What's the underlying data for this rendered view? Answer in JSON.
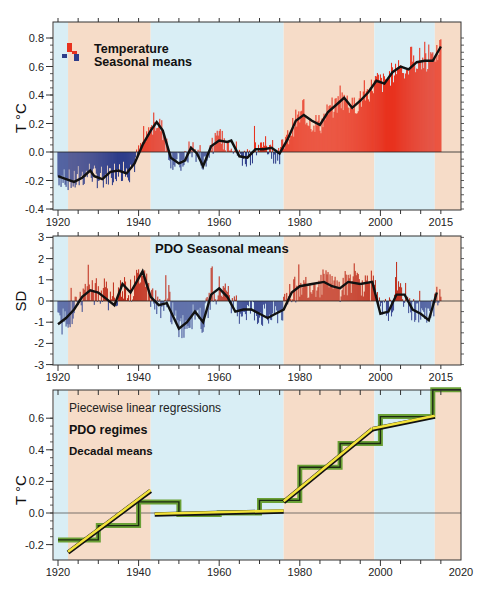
{
  "chart_data": [
    {
      "type": "bar",
      "title": "Temperature Seasonal means",
      "legend": [
        "Temperature",
        "Seasonal means"
      ],
      "ylabel": "T °C",
      "xlabel": "",
      "ylim": [
        -0.4,
        0.85
      ],
      "xlim": [
        1919,
        2020
      ],
      "yticks": [
        "0.8",
        "0.6",
        "0.4",
        "0.2",
        "0.0",
        "-0.2",
        "-0.4"
      ],
      "xticks": [
        "1920",
        "1940",
        "1960",
        "1980",
        "2000",
        "2015"
      ],
      "colors": {
        "positive": "#e8321e",
        "negative": "#2e3d8a",
        "smooth": "#111111"
      },
      "smoothed_curve": {
        "x": [
          1920,
          1922,
          1924,
          1926,
          1928,
          1929,
          1931,
          1933,
          1935,
          1937,
          1939,
          1941,
          1943,
          1944.5,
          1946,
          1948,
          1950,
          1951.5,
          1953,
          1954.5,
          1956,
          1958,
          1960,
          1962,
          1963,
          1965,
          1967,
          1969,
          1971,
          1973,
          1975,
          1977,
          1979,
          1981,
          1983,
          1985,
          1987,
          1989,
          1991,
          1993,
          1995,
          1997,
          1999,
          2001,
          2003,
          2005,
          2007,
          2009,
          2011,
          2013,
          2015
        ],
        "y": [
          -0.17,
          -0.19,
          -0.21,
          -0.18,
          -0.13,
          -0.17,
          -0.19,
          -0.14,
          -0.13,
          -0.15,
          -0.08,
          0.05,
          0.15,
          0.21,
          0.15,
          -0.04,
          -0.08,
          -0.06,
          0.03,
          -0.01,
          -0.1,
          0.04,
          0.08,
          0.07,
          0.08,
          -0.03,
          -0.04,
          0.02,
          0.02,
          0.03,
          -0.01,
          0.09,
          0.22,
          0.26,
          0.22,
          0.19,
          0.28,
          0.33,
          0.38,
          0.31,
          0.36,
          0.42,
          0.5,
          0.48,
          0.56,
          0.6,
          0.58,
          0.63,
          0.64,
          0.64,
          0.74
        ]
      }
    },
    {
      "type": "bar",
      "title": "PDO Seasonal means",
      "ylabel": "SD",
      "xlabel": "",
      "ylim": [
        -3,
        3
      ],
      "xlim": [
        1919,
        2020
      ],
      "yticks": [
        "3",
        "2",
        "1",
        "0",
        "-1",
        "-2",
        "-3"
      ],
      "xticks": [
        "1920",
        "1940",
        "1960",
        "1980",
        "2000",
        "2015"
      ],
      "colors": {
        "positive": "#c0301e",
        "negative": "#3f4f96",
        "smooth": "#111111"
      },
      "smoothed_curve": {
        "x": [
          1920,
          1922,
          1924,
          1926,
          1928,
          1930,
          1932,
          1934,
          1936,
          1938,
          1941,
          1943,
          1945,
          1947,
          1950,
          1952,
          1954,
          1956,
          1958,
          1960,
          1962,
          1964,
          1966,
          1968,
          1970,
          1972,
          1974,
          1976,
          1978,
          1980,
          1983,
          1986,
          1988,
          1990,
          1992,
          1995,
          1998,
          2000,
          2002,
          2004,
          2006,
          2008,
          2010,
          2012,
          2014
        ],
        "y": [
          -1.1,
          -0.8,
          -0.4,
          0.2,
          0.5,
          0.4,
          0.1,
          -0.2,
          0.8,
          0.4,
          1.4,
          0.2,
          -0.2,
          -0.1,
          -1.3,
          -1.0,
          -0.5,
          -1.0,
          0.3,
          0.6,
          0.2,
          -0.5,
          -0.4,
          -0.4,
          -0.6,
          -0.8,
          -0.6,
          -0.4,
          0.4,
          0.7,
          0.8,
          0.9,
          0.7,
          0.6,
          0.9,
          0.8,
          0.9,
          -0.6,
          -0.5,
          0.3,
          0.3,
          -0.4,
          -0.6,
          -0.9,
          0.4
        ]
      }
    },
    {
      "type": "line",
      "title": "",
      "ylabel": "T °C",
      "xlabel": "",
      "ylim": [
        -0.27,
        0.8
      ],
      "xlim": [
        1919,
        2020
      ],
      "yticks": [
        "0.6",
        "0.4",
        "0.2",
        "0.0",
        "-0.2"
      ],
      "xticks": [
        "1920",
        "1940",
        "1960",
        "1980",
        "2000",
        "2020"
      ],
      "annotations": [
        "Piecewise linear regressions",
        "PDO regimes",
        "Decadal means"
      ],
      "series": [
        {
          "name": "Decadal means",
          "color": "#6aa036",
          "x": [
            1920,
            1930,
            1930,
            1940,
            1940,
            1950,
            1950,
            1960,
            1960,
            1970,
            1970,
            1975,
            1975,
            1980,
            1980,
            1990,
            1990,
            2000,
            2000,
            2013,
            2013,
            2020
          ],
          "y": [
            -0.17,
            -0.17,
            -0.08,
            -0.08,
            0.07,
            0.07,
            -0.01,
            -0.01,
            0.0,
            0.0,
            0.08,
            0.08,
            0.08,
            0.08,
            0.29,
            0.29,
            0.44,
            0.44,
            0.61,
            0.61,
            0.78,
            0.78
          ]
        },
        {
          "name": "Piecewise linear regressions (PDO regimes)",
          "color": "#f2e23a",
          "segments": [
            {
              "x": [
                1922.5,
                1943
              ],
              "y": [
                -0.25,
                0.14
              ]
            },
            {
              "x": [
                1944,
                1976
              ],
              "y": [
                -0.01,
                0.01
              ]
            },
            {
              "x": [
                1976,
                1998
              ],
              "y": [
                0.07,
                0.53
              ]
            },
            {
              "x": [
                1998,
                2013.5
              ],
              "y": [
                0.53,
                0.61
              ]
            }
          ]
        }
      ]
    }
  ],
  "regimes": [
    {
      "start": 1919,
      "end": 1922.5,
      "phase": "cool",
      "color": "#d9eef5"
    },
    {
      "start": 1922.5,
      "end": 1943,
      "phase": "warm",
      "color": "#f6dcc8"
    },
    {
      "start": 1943,
      "end": 1976,
      "phase": "cool",
      "color": "#d9eef5"
    },
    {
      "start": 1976,
      "end": 1998.5,
      "phase": "warm",
      "color": "#f6dcc8"
    },
    {
      "start": 1998.5,
      "end": 2013.5,
      "phase": "cool",
      "color": "#d9eef5"
    },
    {
      "start": 2013.5,
      "end": 2020,
      "phase": "warm",
      "color": "#f6dcc8"
    }
  ],
  "labels": {
    "p1_legend_line1": "Temperature",
    "p1_legend_line2": "Seasonal means",
    "p1_ylabel": "T °C",
    "p2_title": "PDO Seasonal means",
    "p2_ylabel": "SD",
    "p3_line1": "Piecewise linear regressions",
    "p3_line2": "PDO regimes",
    "p3_line3": "Decadal means",
    "p3_ylabel": "T °C"
  }
}
